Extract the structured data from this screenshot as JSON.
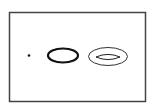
{
  "diagram": {
    "background": "#ffffff",
    "frame": {
      "x": 9.5,
      "y": 12.5,
      "width": 136,
      "height": 89,
      "stroke": "#444444",
      "stroke_width": 1.5
    },
    "shapes": [
      {
        "id": "dot",
        "kind": "point",
        "cx": 29,
        "cy": 55.5,
        "r": 1.3,
        "fill": "#1a1a1a"
      },
      {
        "id": "thick-ellipse",
        "kind": "ellipse",
        "cx": 63,
        "cy": 55.5,
        "rx": 15,
        "ry": 7,
        "stroke": "#111111",
        "stroke_width": 2.2
      },
      {
        "id": "outer-thin-ellipse",
        "kind": "ellipse",
        "cx": 108,
        "cy": 56.5,
        "rx": 19.5,
        "ry": 9,
        "stroke": "#333333",
        "stroke_width": 1
      },
      {
        "id": "inner-lens",
        "kind": "lens",
        "x1": 96,
        "x2": 120,
        "cy": 57,
        "half_height": 2.6,
        "stroke": "#222222",
        "stroke_width": 1
      }
    ]
  }
}
